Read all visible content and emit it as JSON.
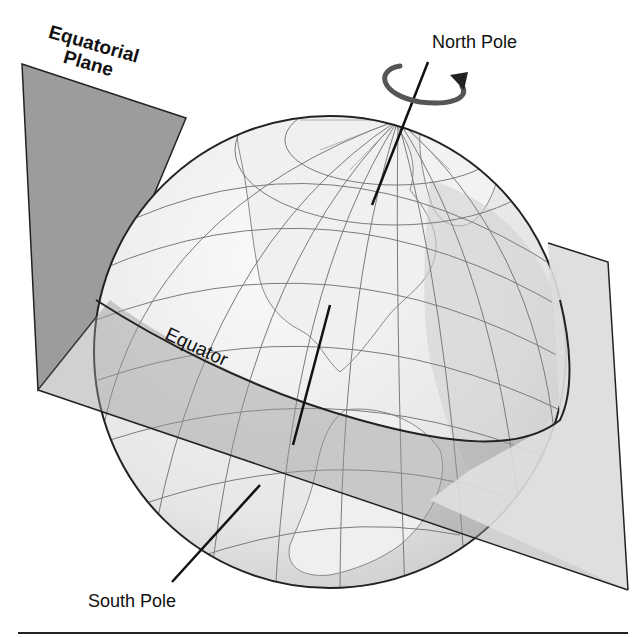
{
  "figure": {
    "labels": {
      "equatorial_plane_line1": "Equatorial",
      "equatorial_plane_line2": "Plane",
      "north_pole": "North Pole",
      "south_pole": "South Pole",
      "equator": "Equator"
    },
    "colors": {
      "plane_dark": "#9a9a9a",
      "plane_light": "#e4e4e4",
      "globe_ocean": "#f2f2f2",
      "land": "#d2d2d2",
      "grid": "#7a7a7a",
      "outline": "#222222"
    },
    "elements": [
      "equatorial-plane",
      "globe",
      "rotation-axis",
      "rotation-arrow",
      "equator-line"
    ]
  }
}
